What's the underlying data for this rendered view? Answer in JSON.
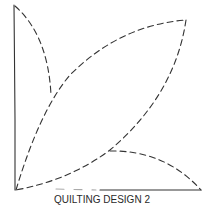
{
  "diagram": {
    "caption": "QUILTING DESIGN 2",
    "stroke_color": "#333333",
    "elements": [
      {
        "name": "vertical-edge",
        "style": "solid"
      },
      {
        "name": "small-leaf",
        "style": "dashed"
      },
      {
        "name": "large-leaf",
        "style": "dashed"
      },
      {
        "name": "bottom-leaf",
        "style": "dashed"
      },
      {
        "name": "bottom-edge",
        "style": "solid"
      }
    ]
  }
}
